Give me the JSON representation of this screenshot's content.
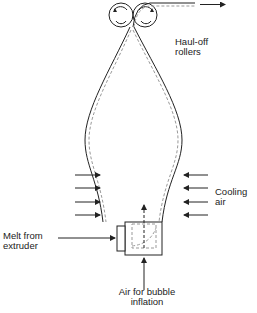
{
  "diagram": {
    "labels": {
      "haul_off_line1": "Haul-off",
      "haul_off_line2": "rollers",
      "cooling_line1": "Cooling",
      "cooling_line2": "air",
      "melt_line1": "Melt from",
      "melt_line2": "extruder",
      "air_line1": "Air for bubble",
      "air_line2": "inflation"
    },
    "colors": {
      "stroke": "#222222",
      "dashed": "#999999",
      "background": "#ffffff"
    }
  }
}
